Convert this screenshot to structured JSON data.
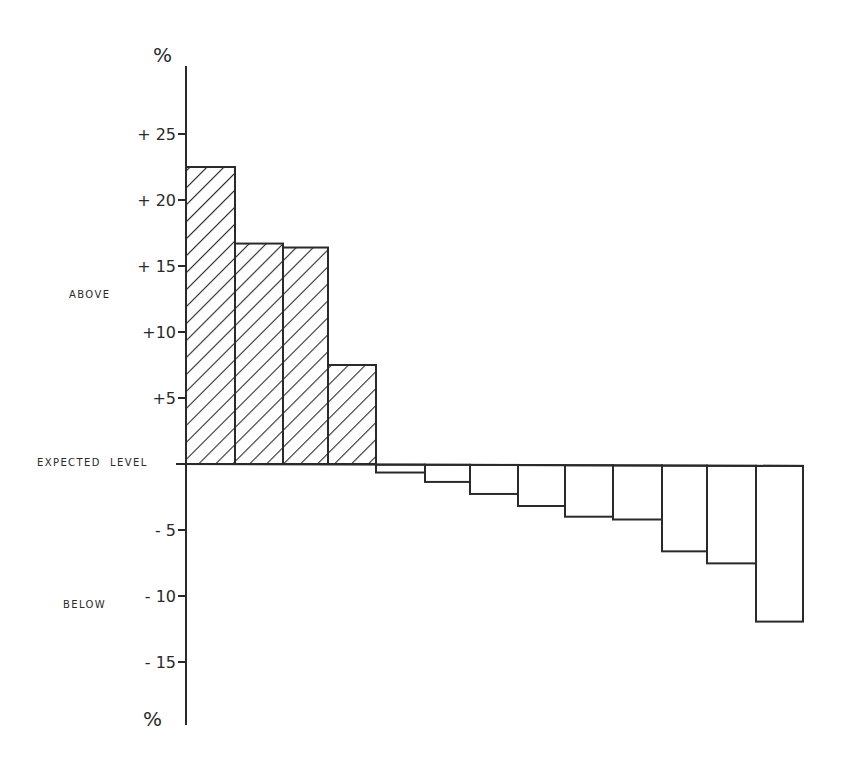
{
  "chart_data": {
    "type": "bar",
    "title": "",
    "xlabel": "",
    "ylabel": "%",
    "ylabel_bottom": "%",
    "ylim": [
      -19,
      30
    ],
    "yticks": [
      25,
      20,
      15,
      10,
      5,
      -5,
      -10,
      -15
    ],
    "ytick_labels": [
      "+ 25",
      "+ 20",
      "+ 15",
      "+10",
      "+5",
      "- 5",
      "- 10",
      "- 15"
    ],
    "grid": false,
    "legend": null,
    "baseline_label": "EXPECTED  LEVEL",
    "region_labels": {
      "above": "ABOVE",
      "below": "BELOW"
    },
    "categories": [
      "1",
      "2",
      "3",
      "4",
      "5",
      "6",
      "7",
      "8",
      "9",
      "10",
      "11",
      "12",
      "13"
    ],
    "values": [
      22.5,
      16.7,
      16.4,
      7.5,
      -0.6,
      -1.3,
      -2.2,
      -3.1,
      -3.9,
      -4.1,
      -6.5,
      -7.4,
      -11.8
    ],
    "positive_fill": "hatched",
    "negative_fill": "none",
    "colors": {
      "stroke": "#2a2a2a",
      "background": "#ffffff"
    }
  }
}
